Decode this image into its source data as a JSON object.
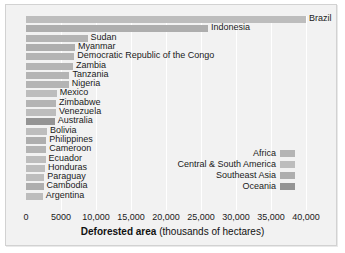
{
  "chart_data": {
    "type": "bar",
    "orientation": "horizontal",
    "title": "",
    "xlabel_strong": "Deforested area",
    "xlabel_rest": "(thousands of hectares)",
    "ylabel": "",
    "xlim": [
      0,
      40000
    ],
    "xticks": [
      0,
      5000,
      10000,
      15000,
      20000,
      25000,
      30000,
      35000,
      40000
    ],
    "xticklabels": [
      "0",
      "5000",
      "10,000",
      "15,000",
      "20,000",
      "25,000",
      "30,000",
      "35,000",
      "40,000"
    ],
    "grid": true,
    "legend_position": "inside-right",
    "categories": [
      "Brazil",
      "Indonesia",
      "Sudan",
      "Myanmar",
      "Democratic Republic of the Congo",
      "Zambia",
      "Tanzania",
      "Nigeria",
      "Mexico",
      "Zimbabwe",
      "Venezuela",
      "Australia",
      "Bolivia",
      "Philippines",
      "Cameroon",
      "Ecuador",
      "Honduras",
      "Paraguay",
      "Cambodia",
      "Argentina"
    ],
    "values": [
      40500,
      26000,
      8800,
      7000,
      6900,
      6700,
      6200,
      6100,
      4400,
      4300,
      4300,
      4100,
      3000,
      2900,
      2900,
      2800,
      2700,
      2600,
      2500,
      2400
    ],
    "regions": [
      "Central & South America",
      "Southeast Asia",
      "Africa",
      "Southeast Asia",
      "Africa",
      "Africa",
      "Africa",
      "Africa",
      "Central & South America",
      "Africa",
      "Central & South America",
      "Oceania",
      "Central & South America",
      "Southeast Asia",
      "Africa",
      "Central & South America",
      "Central & South America",
      "Central & South America",
      "Southeast Asia",
      "Central & South America"
    ],
    "legend": [
      {
        "label": "Africa",
        "color": "#b4b4b4"
      },
      {
        "label": "Central & South America",
        "color": "#bdbdbd"
      },
      {
        "label": "Southeast Asia",
        "color": "#aeaeae"
      },
      {
        "label": "Oceania",
        "color": "#949494"
      }
    ],
    "colors": {
      "Africa": "#b4b4b4",
      "Central & South America": "#bdbdbd",
      "Southeast Asia": "#aeaeae",
      "Oceania": "#949494",
      "plot_background": "#f2f2f2",
      "gridline": "#ffffff",
      "text": "#1a1a1a"
    }
  }
}
